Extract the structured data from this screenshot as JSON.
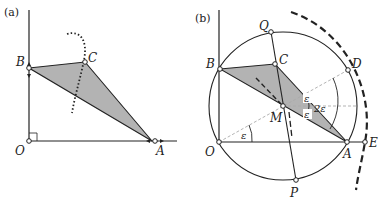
{
  "panels": [
    {
      "id": "a",
      "label": "(a)",
      "points": {
        "O": "O",
        "A": "A",
        "B": "B",
        "C": "C"
      }
    },
    {
      "id": "b",
      "label": "(b)",
      "points": {
        "O": "O",
        "A": "A",
        "B": "B",
        "C": "C",
        "D": "D",
        "E": "E",
        "M": "M",
        "P": "P",
        "Q": "Q"
      },
      "angles": {
        "eps_O": "ε",
        "eps_top": "ε",
        "eps_bottom": "ε",
        "two_eps": "2ε"
      }
    }
  ],
  "colors": {
    "triangle_fill": "#b3b3b3",
    "line": "#222222",
    "dashed_helper": "#aaaaaa"
  }
}
